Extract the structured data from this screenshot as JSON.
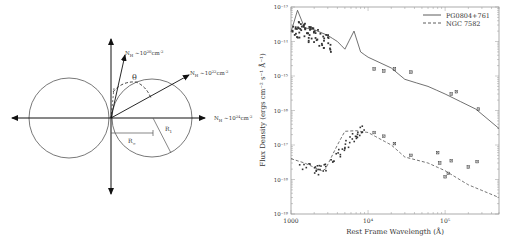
{
  "diagram": {
    "labels": {
      "nh_20": "N",
      "nh_20_sub": "H",
      "nh_20_rest": " ~10",
      "nh_20_exp": "20",
      "nh_20_unit": "cm",
      "nh_20_unit_exp": "-2",
      "nh_22": "N",
      "nh_22_sub": "H",
      "nh_22_rest": " ~10",
      "nh_22_exp": "22",
      "nh_22_unit": "cm",
      "nh_22_unit_exp": "-2",
      "nh_24": "N",
      "nh_24_sub": "H",
      "nh_24_rest": " ~10",
      "nh_24_exp": "24",
      "nh_24_unit": "cm",
      "nh_24_unit_exp": "-2",
      "theta": "θ",
      "r_inf": "R",
      "r_inf_sub": "∞",
      "r_1": "R",
      "r_1_sub": "1"
    }
  },
  "chart_data": {
    "type": "line",
    "title": "",
    "xlabel": "Rest Frame Wavelength (Å)",
    "ylabel": "Flux Density (ergs cm⁻² s⁻¹ Å⁻¹)",
    "xscale": "log",
    "yscale": "log",
    "xlim": [
      1000,
      500000
    ],
    "ylim": [
      1e-19,
      1e-13
    ],
    "x_tick_labels": [
      "1000",
      "10⁴",
      "10⁵"
    ],
    "y_tick_labels": [
      "10⁻¹³",
      "10⁻¹⁴",
      "10⁻¹⁵",
      "10⁻¹⁶",
      "10⁻¹⁷",
      "10⁻¹⁸",
      "10⁻¹⁹"
    ],
    "legend_position": "upper right",
    "grid": false,
    "series": [
      {
        "name": "PG0804+761",
        "style": "solid",
        "x": [
          1000,
          1216,
          1500,
          2000,
          3000,
          4000,
          5000,
          6563,
          8000,
          10000,
          20000,
          30000,
          60000,
          100000,
          250000,
          500000
        ],
        "y": [
          1.9e-14,
          8e-14,
          2.5e-14,
          2.2e-14,
          1.5e-14,
          1e-14,
          6e-15,
          2e-14,
          5e-15,
          3.5e-15,
          1.7e-15,
          8e-16,
          5e-16,
          3e-16,
          1.1e-16,
          3e-17
        ]
      },
      {
        "name": "NGC 7582",
        "style": "dashed",
        "x": [
          1000,
          1500,
          2500,
          2800,
          4000,
          5000,
          7000,
          10000,
          20000,
          30000,
          60000,
          100000,
          200000,
          500000
        ],
        "y": [
          4e-18,
          3e-18,
          1.8e-18,
          2e-18,
          1e-17,
          2.5e-17,
          2.6e-17,
          2.3e-17,
          1e-17,
          4.5e-18,
          3e-18,
          1.8e-18,
          7e-19,
          3e-19
        ]
      }
    ],
    "photometry_points": [
      {
        "series": "PG0804+761",
        "x": 12000,
        "y": 1.6e-15
      },
      {
        "series": "PG0804+761",
        "x": 16000,
        "y": 1.4e-15
      },
      {
        "series": "PG0804+761",
        "x": 22000,
        "y": 1.6e-15
      },
      {
        "series": "PG0804+761",
        "x": 36000,
        "y": 1.3e-15
      },
      {
        "series": "PG0804+761",
        "x": 120000,
        "y": 3e-16
      },
      {
        "series": "PG0804+761",
        "x": 140000,
        "y": 3.5e-16
      },
      {
        "series": "PG0804+761",
        "x": 270000,
        "y": 1.1e-16
      },
      {
        "series": "NGC 7582",
        "x": 12000,
        "y": 2.3e-17
      },
      {
        "series": "NGC 7582",
        "x": 16000,
        "y": 1.8e-17
      },
      {
        "series": "NGC 7582",
        "x": 22000,
        "y": 1.1e-17
      },
      {
        "series": "NGC 7582",
        "x": 36000,
        "y": 5e-18
      },
      {
        "series": "NGC 7582",
        "x": 80000,
        "y": 6e-18
      },
      {
        "series": "NGC 7582",
        "x": 85000,
        "y": 3e-18
      },
      {
        "series": "NGC 7582",
        "x": 100000,
        "y": 1.2e-18
      },
      {
        "series": "NGC 7582",
        "x": 110000,
        "y": 1.5e-18
      },
      {
        "series": "NGC 7582",
        "x": 120000,
        "y": 3.5e-18
      },
      {
        "series": "NGC 7582",
        "x": 200000,
        "y": 2.3e-18
      },
      {
        "series": "NGC 7582",
        "x": 260000,
        "y": 3.3e-18
      }
    ]
  }
}
